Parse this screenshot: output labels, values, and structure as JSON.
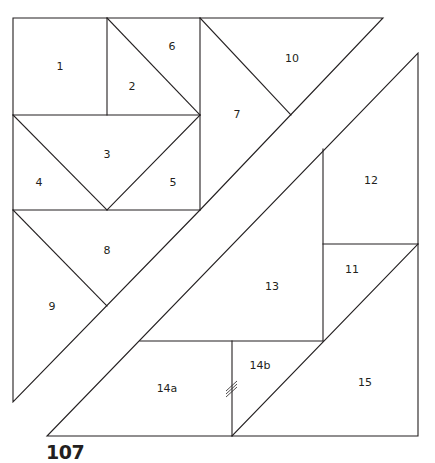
{
  "pattern": {
    "number": "107",
    "line_color": "#231f20",
    "background": "#ffffff"
  },
  "pieces": [
    {
      "id": "1",
      "label": "1",
      "x": 60,
      "y": 67
    },
    {
      "id": "2",
      "label": "2",
      "x": 132,
      "y": 87
    },
    {
      "id": "3",
      "label": "3",
      "x": 107,
      "y": 155
    },
    {
      "id": "4",
      "label": "4",
      "x": 39,
      "y": 183
    },
    {
      "id": "5",
      "label": "5",
      "x": 173,
      "y": 183
    },
    {
      "id": "6",
      "label": "6",
      "x": 172,
      "y": 47
    },
    {
      "id": "7",
      "label": "7",
      "x": 237,
      "y": 115
    },
    {
      "id": "8",
      "label": "8",
      "x": 107,
      "y": 251
    },
    {
      "id": "9",
      "label": "9",
      "x": 52,
      "y": 307
    },
    {
      "id": "10",
      "label": "10",
      "x": 292,
      "y": 59
    },
    {
      "id": "11",
      "label": "11",
      "x": 352,
      "y": 270
    },
    {
      "id": "12",
      "label": "12",
      "x": 371,
      "y": 181
    },
    {
      "id": "13",
      "label": "13",
      "x": 272,
      "y": 287
    },
    {
      "id": "14a",
      "label": "14a",
      "x": 167,
      "y": 389
    },
    {
      "id": "14b",
      "label": "14b",
      "x": 260,
      "y": 366
    },
    {
      "id": "15",
      "label": "15",
      "x": 365,
      "y": 383
    }
  ]
}
